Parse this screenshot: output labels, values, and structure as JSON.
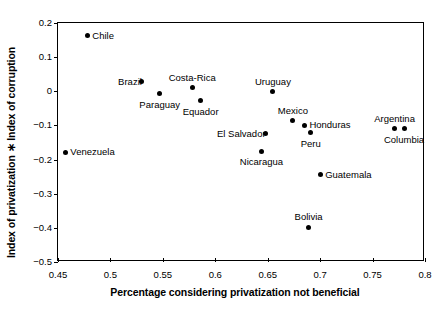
{
  "chart_data": {
    "type": "scatter",
    "title": "",
    "xlabel": "Percentage considering privatization not beneficial",
    "ylabel": "Index of privatization ∗ Index of corruption",
    "xlim": [
      0.45,
      0.8
    ],
    "ylim": [
      -0.5,
      0.2
    ],
    "xticks": [
      "0.45",
      "0.5",
      "0.55",
      "0.6",
      "0.65",
      "0.7",
      "0.75",
      "0.8"
    ],
    "xtick_values": [
      0.45,
      0.5,
      0.55,
      0.6,
      0.65,
      0.7,
      0.75,
      0.8
    ],
    "yticks": [
      "0.2",
      "0.1",
      "0",
      "−0.1",
      "−0.2",
      "−0.3",
      "−0.4",
      "−0.5"
    ],
    "ytick_values": [
      0.2,
      0.1,
      0,
      -0.1,
      -0.2,
      -0.3,
      -0.4,
      -0.5
    ],
    "grid": false,
    "legend": "none",
    "marker_color": "#000000",
    "points": [
      {
        "label": "Chile",
        "x": 0.478,
        "y": 0.163,
        "label_pos": "right"
      },
      {
        "label": "Brazil",
        "x": 0.53,
        "y": 0.028,
        "label_pos": "left-of"
      },
      {
        "label": "Costa-Rica",
        "x": 0.578,
        "y": 0.01,
        "label_pos": "above"
      },
      {
        "label": "Paraguay",
        "x": 0.547,
        "y": -0.007,
        "label_pos": "below"
      },
      {
        "label": "Equador",
        "x": 0.586,
        "y": -0.027,
        "label_pos": "below"
      },
      {
        "label": "Uruguay",
        "x": 0.655,
        "y": -0.002,
        "label_pos": "above"
      },
      {
        "label": "Mexico",
        "x": 0.674,
        "y": -0.087,
        "label_pos": "above"
      },
      {
        "label": "Honduras",
        "x": 0.685,
        "y": -0.099,
        "label_pos": "right"
      },
      {
        "label": "Argentina",
        "x": 0.771,
        "y": -0.11,
        "label_pos": "above"
      },
      {
        "label": "Columbia",
        "x": 0.78,
        "y": -0.11,
        "label_pos": "below"
      },
      {
        "label": "Peru",
        "x": 0.691,
        "y": -0.122,
        "label_pos": "below"
      },
      {
        "label": "El Salvador",
        "x": 0.648,
        "y": -0.125,
        "label_pos": "left-of"
      },
      {
        "label": "Venezuela",
        "x": 0.457,
        "y": -0.178,
        "label_pos": "right"
      },
      {
        "label": "Nicaragua",
        "x": 0.644,
        "y": -0.175,
        "label_pos": "below"
      },
      {
        "label": "Guatemala",
        "x": 0.7,
        "y": -0.245,
        "label_pos": "right"
      },
      {
        "label": "Bolivia",
        "x": 0.689,
        "y": -0.398,
        "label_pos": "above"
      }
    ]
  }
}
